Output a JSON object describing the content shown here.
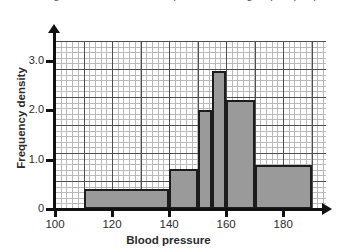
{
  "figure": {
    "cropped_title": "The histogram shows the blood pressure of a group of people."
  },
  "chart_data": {
    "type": "bar",
    "title": "",
    "xlabel": "Blood pressure",
    "ylabel": "Frequency density",
    "xlim": [
      100,
      195
    ],
    "ylim": [
      0,
      3.4
    ],
    "x_ticks": [
      "100",
      "120",
      "140",
      "160",
      "180"
    ],
    "x_tick_values": [
      100,
      120,
      140,
      160,
      180
    ],
    "y_ticks": [
      "0",
      "1.0",
      "2.0",
      "3.0"
    ],
    "y_tick_values": [
      0,
      1.0,
      2.0,
      3.0
    ],
    "grid": "minor and major grid shown",
    "legend": "none",
    "bar_color": "#9a9a9a",
    "bar_edge_color": "#1c1c1c",
    "bins": [
      {
        "label": "110-140",
        "start": 110,
        "end": 140,
        "value": 0.4
      },
      {
        "label": "140-150",
        "start": 140,
        "end": 150,
        "value": 0.8
      },
      {
        "label": "150-155",
        "start": 150,
        "end": 155,
        "value": 2.0
      },
      {
        "label": "155-160",
        "start": 155,
        "end": 160,
        "value": 2.8
      },
      {
        "label": "160-170",
        "start": 160,
        "end": 170,
        "value": 2.2
      },
      {
        "label": "170-190",
        "start": 170,
        "end": 190,
        "value": 0.9
      }
    ]
  }
}
